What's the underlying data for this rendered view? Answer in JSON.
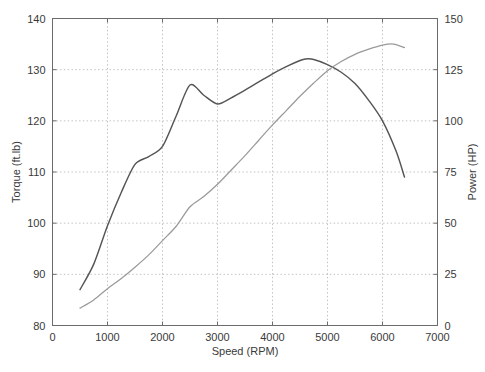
{
  "chart_data": {
    "type": "line",
    "title": "",
    "subtitle": "",
    "xlabel": "Speed (RPM)",
    "ylabel": "Torque (ft.lb)",
    "y2label": "Power (HP)",
    "xlim": [
      0,
      7000
    ],
    "ylim": [
      80,
      140
    ],
    "y2lim": [
      0,
      150
    ],
    "xticks": [
      0,
      1000,
      2000,
      3000,
      4000,
      5000,
      6000,
      7000
    ],
    "xticklabels": [
      "0",
      "1000",
      "2000",
      "3000",
      "4000",
      "5000",
      "6000",
      "7000"
    ],
    "yticks": [
      80,
      90,
      100,
      110,
      120,
      130,
      140
    ],
    "yticklabels": [
      "80",
      "90",
      "100",
      "110",
      "120",
      "130",
      "140"
    ],
    "y2ticks": [
      0,
      25,
      50,
      75,
      100,
      125,
      150
    ],
    "y2ticklabels": [
      "0",
      "25",
      "50",
      "75",
      "100",
      "125",
      "150"
    ],
    "grid": true,
    "grid_style": "dotted",
    "legend": null,
    "legend_position": "none",
    "series": [
      {
        "name": "Torque",
        "axis": "left",
        "unit": "ft.lb",
        "color": "#555555",
        "x": [
          500,
          750,
          1000,
          1250,
          1500,
          1750,
          2000,
          2250,
          2500,
          2750,
          3000,
          3250,
          3500,
          3750,
          4000,
          4250,
          4500,
          4600,
          4750,
          5000,
          5250,
          5500,
          5750,
          6000,
          6250,
          6400
        ],
        "values": [
          87.0,
          92.0,
          99.5,
          106.0,
          111.5,
          113.0,
          115.0,
          121.0,
          127.0,
          125.0,
          123.3,
          124.5,
          126.0,
          127.6,
          129.2,
          130.6,
          131.8,
          132.1,
          132.0,
          131.0,
          129.5,
          127.3,
          124.0,
          120.0,
          114.0,
          109.0
        ]
      },
      {
        "name": "Power",
        "axis": "right",
        "unit": "HP",
        "color": "#9a9a9a",
        "x": [
          500,
          750,
          1000,
          1250,
          1500,
          1750,
          2000,
          2250,
          2500,
          2750,
          3000,
          3250,
          3500,
          3750,
          4000,
          4250,
          4500,
          4750,
          5000,
          5250,
          5500,
          5750,
          6000,
          6200,
          6400
        ],
        "values": [
          8.5,
          12.5,
          18.0,
          23.0,
          28.5,
          34.5,
          41.5,
          48.5,
          58.0,
          63.0,
          69.0,
          76.0,
          83.0,
          90.5,
          98.0,
          105.0,
          112.0,
          118.5,
          124.5,
          129.0,
          132.5,
          135.0,
          137.0,
          137.5,
          135.8
        ]
      }
    ]
  },
  "axes": {
    "left_title": "Torque (ft.lb)",
    "right_title": "Power (HP)",
    "bottom_title": "Speed (RPM)"
  }
}
